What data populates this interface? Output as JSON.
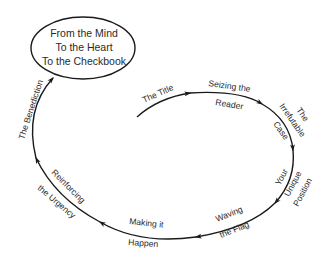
{
  "diagram": {
    "type": "cyclical-flow",
    "goal": {
      "lines": [
        "From the Mind",
        "To the Heart",
        "To the Checkbook"
      ]
    },
    "steps": [
      {
        "id": "title",
        "lines": [
          "The Title"
        ]
      },
      {
        "id": "seizing",
        "lines": [
          "Seizing the",
          "Reader"
        ]
      },
      {
        "id": "irrefutable",
        "lines": [
          "The",
          "Irrefutable",
          "Case"
        ]
      },
      {
        "id": "unique",
        "lines": [
          "Your",
          "Unique",
          "Position"
        ]
      },
      {
        "id": "flag",
        "lines": [
          "Waving",
          "the Flag"
        ]
      },
      {
        "id": "happen",
        "lines": [
          "Making it",
          "Happen"
        ]
      },
      {
        "id": "urgency",
        "lines": [
          "Reinforcing",
          "the Urgency"
        ]
      },
      {
        "id": "benediction",
        "lines": [
          "The Benediction"
        ]
      }
    ],
    "colors": {
      "stroke": "#1a1a1a",
      "text": "#2a2a2a",
      "background": "#ffffff"
    }
  }
}
